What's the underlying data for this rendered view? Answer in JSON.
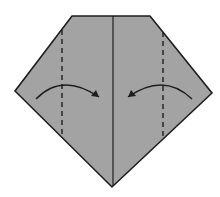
{
  "diagram": {
    "colors": {
      "paper": "#a3a3a3",
      "outline": "#1e1e1e",
      "background": "#ffffff"
    },
    "paper_shape": {
      "type": "pentagon",
      "points": [
        [
          72,
          16
        ],
        [
          150,
          16
        ],
        [
          212,
          93
        ],
        [
          112,
          187
        ],
        [
          15,
          91
        ]
      ]
    },
    "center_crease": {
      "x1": 113,
      "y1": 16,
      "x2": 113,
      "y2": 186
    },
    "valley_folds": [
      {
        "name": "left-valley-fold",
        "x1": 62,
        "y1": 30,
        "x2": 62,
        "y2": 138
      },
      {
        "name": "right-valley-fold",
        "x1": 163,
        "y1": 32,
        "x2": 163,
        "y2": 140
      }
    ],
    "arrows": [
      {
        "name": "left-fold-arrow",
        "direction": "right",
        "path": "M36 99 Q62 72 99 97",
        "head": "99,97 91,96 96,90"
      },
      {
        "name": "right-fold-arrow",
        "direction": "left",
        "path": "M192 99 Q164 72 128 97",
        "head": "128,97 131,90 136,96"
      }
    ]
  }
}
